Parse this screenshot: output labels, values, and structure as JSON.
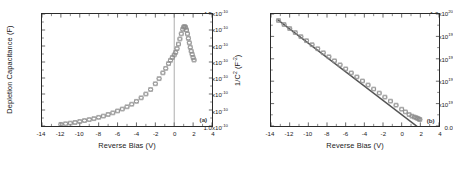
{
  "figure": {
    "background": "#ffffff",
    "axis_color": "#2b2b2b",
    "data_color": "#8c8c8c",
    "line_color": "#555555"
  },
  "panel_a": {
    "tag": "(a)",
    "xlabel": "Reverse Bias (V)",
    "ylabel": "Depletion Capacitance (F)",
    "yticks": [
      {
        "mantissa": "1.0x10",
        "exp": "-10"
      },
      {
        "mantissa": "1.5x10",
        "exp": "-10"
      },
      {
        "mantissa": "2.0x10",
        "exp": "-10"
      },
      {
        "mantissa": "2.5x10",
        "exp": "-10"
      },
      {
        "mantissa": "3.0x10",
        "exp": "-10"
      },
      {
        "mantissa": "3.5x10",
        "exp": "-10"
      },
      {
        "mantissa": "4.0x10",
        "exp": "-10"
      },
      {
        "mantissa": "4.5x10",
        "exp": "-10"
      }
    ],
    "xticks": [
      "-14",
      "-12",
      "-10",
      "-8",
      "-6",
      "-4",
      "-2",
      "0",
      "2",
      "4"
    ]
  },
  "panel_b": {
    "tag": "(b)",
    "xlabel": "Reverse Bias (V)",
    "ylabel_pre": "1/C",
    "ylabel_sup": "2",
    "ylabel_post": " (F",
    "ylabel_sup2": "-2",
    "ylabel_end": ")",
    "yticks": [
      {
        "mantissa": "0.0",
        "exp": ""
      },
      {
        "mantissa": "2.0x10",
        "exp": "19"
      },
      {
        "mantissa": "4.0x10",
        "exp": "19"
      },
      {
        "mantissa": "6.0x10",
        "exp": "19"
      },
      {
        "mantissa": "8.0x10",
        "exp": "19"
      },
      {
        "mantissa": "1.0x10",
        "exp": "20"
      }
    ],
    "xticks": [
      "-14",
      "-12",
      "-10",
      "-8",
      "-6",
      "-4",
      "-2",
      "0",
      "2",
      "4"
    ]
  },
  "chart_data": [
    {
      "type": "scatter",
      "panel": "(a)",
      "title": "",
      "xlabel": "Reverse Bias (V)",
      "ylabel": "Depletion Capacitance (F)",
      "xlim": [
        -14,
        4
      ],
      "ylim": [
        1e-10,
        4.5e-10
      ],
      "xtick_values": [
        -14,
        -12,
        -10,
        -8,
        -6,
        -4,
        -2,
        0,
        2,
        4
      ],
      "ytick_values": [
        1e-10,
        1.5e-10,
        2e-10,
        2.5e-10,
        3e-10,
        3.5e-10,
        4e-10,
        4.5e-10
      ],
      "grid": false,
      "legend": null,
      "annotations": [
        {
          "text": "(a)",
          "x": 2.6,
          "y": 1.22e-10
        }
      ],
      "vertical_reference_line": 0,
      "marker": "open-circle-and-square",
      "x": [
        -12.0,
        -11.5,
        -11.0,
        -10.5,
        -10.0,
        -9.5,
        -9.0,
        -8.5,
        -8.0,
        -7.5,
        -7.0,
        -6.5,
        -6.0,
        -5.5,
        -5.0,
        -4.5,
        -4.0,
        -3.5,
        -3.0,
        -2.5,
        -2.0,
        -1.6,
        -1.2,
        -0.9,
        -0.6,
        -0.4,
        -0.2,
        0.0,
        0.15,
        0.3,
        0.45,
        0.6,
        0.75,
        0.9,
        1.0,
        1.1,
        1.2,
        1.3,
        1.4,
        1.5,
        1.6,
        1.7,
        1.8,
        1.9,
        2.0,
        2.1
      ],
      "y": [
        1.05e-10,
        1.07e-10,
        1.09e-10,
        1.11e-10,
        1.14e-10,
        1.17e-10,
        1.2e-10,
        1.23e-10,
        1.27e-10,
        1.31e-10,
        1.36e-10,
        1.41e-10,
        1.47e-10,
        1.53e-10,
        1.6e-10,
        1.68e-10,
        1.77e-10,
        1.88e-10,
        2e-10,
        2.14e-10,
        2.32e-10,
        2.48e-10,
        2.66e-10,
        2.8e-10,
        2.95e-10,
        3.05e-10,
        3.14e-10,
        3.22e-10,
        3.3e-10,
        3.42e-10,
        3.56e-10,
        3.72e-10,
        3.88e-10,
        4.02e-10,
        4.09e-10,
        4.11e-10,
        4.08e-10,
        4e-10,
        3.88e-10,
        3.74e-10,
        3.6e-10,
        3.46e-10,
        3.34e-10,
        3.24e-10,
        3.14e-10,
        3.06e-10
      ]
    },
    {
      "type": "scatter",
      "panel": "(b)",
      "title": "",
      "xlabel": "Reverse Bias (V)",
      "ylabel": "1/C2 (F-2)",
      "xlim": [
        -14,
        4
      ],
      "ylim": [
        0.0,
        1e+20
      ],
      "xtick_values": [
        -14,
        -12,
        -10,
        -8,
        -6,
        -4,
        -2,
        0,
        2,
        4
      ],
      "ytick_values": [
        0.0,
        2e+19,
        4e+19,
        6e+19,
        8e+19,
        1e+20
      ],
      "grid": false,
      "legend": null,
      "annotations": [
        {
          "text": "(b)",
          "x": 2.6,
          "y": 5.5e+18
        }
      ],
      "fit_line": {
        "x": [
          -13.3,
          2.45
        ],
        "y": [
          9.5e+19,
          -5.5e+18
        ]
      },
      "marker": "open-circle-and-square",
      "x": [
        -13.2,
        -12.6,
        -12.0,
        -11.4,
        -10.8,
        -10.2,
        -9.6,
        -9.0,
        -8.4,
        -7.8,
        -7.2,
        -6.6,
        -6.0,
        -5.4,
        -4.8,
        -4.2,
        -3.6,
        -3.0,
        -2.4,
        -1.8,
        -1.2,
        -0.6,
        0.0,
        0.4,
        0.8,
        1.1,
        1.35,
        1.55,
        1.7,
        1.85,
        1.95
      ],
      "y": [
        9.42e+19,
        9.06e+19,
        8.7e+19,
        8.34e+19,
        7.98e+19,
        7.62e+19,
        7.26e+19,
        6.9e+19,
        6.54e+19,
        6.18e+19,
        5.82e+19,
        5.46e+19,
        5.1e+19,
        4.74e+19,
        4.38e+19,
        4.02e+19,
        3.66e+19,
        3.3e+19,
        2.94e+19,
        2.58e+19,
        2.22e+19,
        1.86e+19,
        1.5e+19,
        1.26e+19,
        1.02e+19,
        8.8e+18,
        8e+18,
        7.4e+18,
        6.8e+18,
        6.2e+18,
        5.8e+18
      ]
    }
  ]
}
